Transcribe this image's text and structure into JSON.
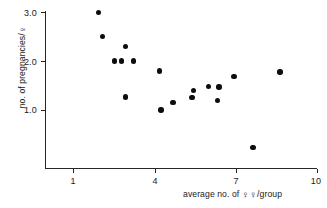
{
  "chart_data": {
    "type": "scatter",
    "title": "",
    "xlabel": "average no. of ♀♀/group",
    "ylabel": "no. of pregnancies/♀",
    "xlim": [
      0.25,
      10.0
    ],
    "ylim": [
      0.0,
      3.15
    ],
    "grid": false,
    "legend": null,
    "xticks": [
      1,
      4,
      7,
      10
    ],
    "xtick_labels": [
      "1",
      "4",
      "7",
      "10"
    ],
    "yticks": [
      1.0,
      2.0,
      3.0
    ],
    "ytick_labels": [
      "1.0",
      "2.0",
      "3.0"
    ],
    "marker": "filled-circle",
    "marker_color": "#0d0d0d",
    "axis_color": "#262626",
    "background_color": "#ffffff",
    "n_points": 17,
    "points": [
      {
        "x": 1.95,
        "y": 3.0
      },
      {
        "x": 2.1,
        "y": 2.5
      },
      {
        "x": 2.55,
        "y": 2.0
      },
      {
        "x": 2.8,
        "y": 2.0
      },
      {
        "x": 2.95,
        "y": 2.3
      },
      {
        "x": 3.25,
        "y": 2.0
      },
      {
        "x": 2.95,
        "y": 1.27
      },
      {
        "x": 4.2,
        "y": 1.8
      },
      {
        "x": 4.25,
        "y": 1.0
      },
      {
        "x": 4.7,
        "y": 1.15
      },
      {
        "x": 5.4,
        "y": 1.25
      },
      {
        "x": 5.45,
        "y": 1.4
      },
      {
        "x": 6.0,
        "y": 1.48
      },
      {
        "x": 6.35,
        "y": 1.2
      },
      {
        "x": 6.4,
        "y": 1.47
      },
      {
        "x": 6.95,
        "y": 1.68
      },
      {
        "x": 7.65,
        "y": 0.23
      },
      {
        "x": 8.65,
        "y": 1.78
      }
    ]
  },
  "axes": {
    "y_title": "no. of pregnancies/",
    "y_title_symbol": "♀",
    "x_title_prefix": "average no. of ",
    "x_title_symbol": "♀",
    "x_title_suffix": "/group"
  }
}
